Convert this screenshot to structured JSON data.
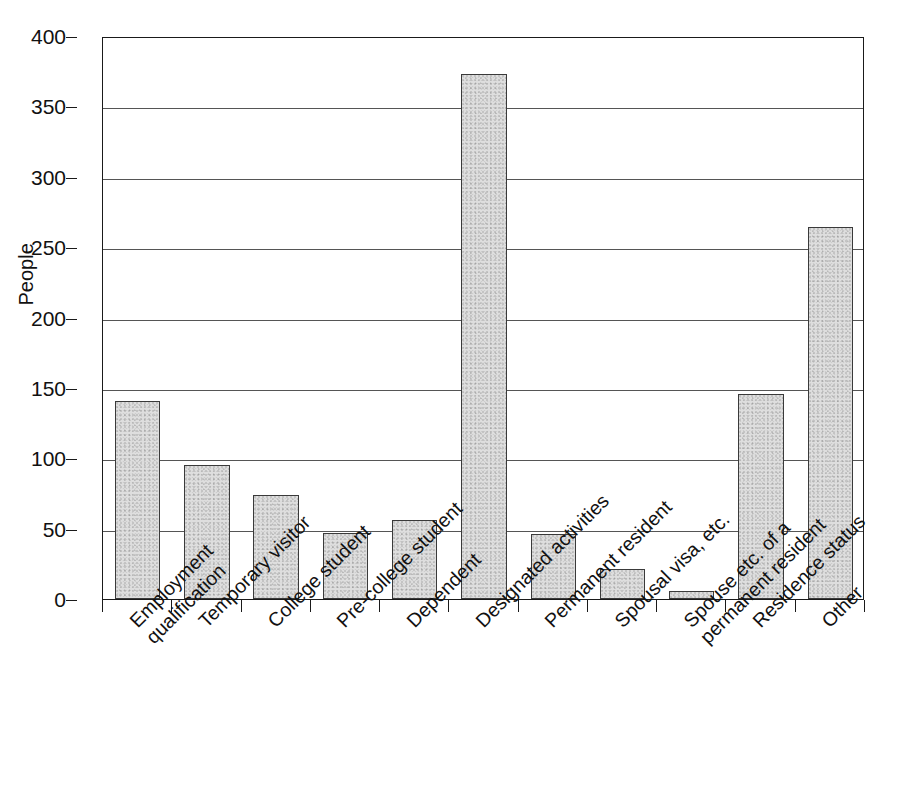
{
  "chart_data": {
    "type": "bar",
    "title": "",
    "xlabel": "",
    "ylabel": "People",
    "ylim": [
      0,
      400
    ],
    "yticks": [
      0,
      50,
      100,
      150,
      200,
      250,
      300,
      350,
      400
    ],
    "grid": true,
    "legend": false,
    "bar_color": "#dedede",
    "bar_edge_color": "#3a3a3a",
    "categories": [
      "Employment\nqualification",
      "Temporary visitor",
      "College student",
      "Pre-college student",
      "Dependent",
      "Designated activities",
      "Permanent resident",
      "Spousal visa, etc.",
      "Spouse etc. of a\npermanent resident",
      "Residence status",
      "Other"
    ],
    "values": [
      141,
      95,
      74,
      47,
      56,
      373,
      46,
      21,
      6,
      146,
      264
    ]
  },
  "axis": {
    "y_title": "People",
    "y_tick_labels": [
      "400",
      "350",
      "300",
      "250",
      "200",
      "150",
      "100",
      "50",
      "0"
    ]
  }
}
